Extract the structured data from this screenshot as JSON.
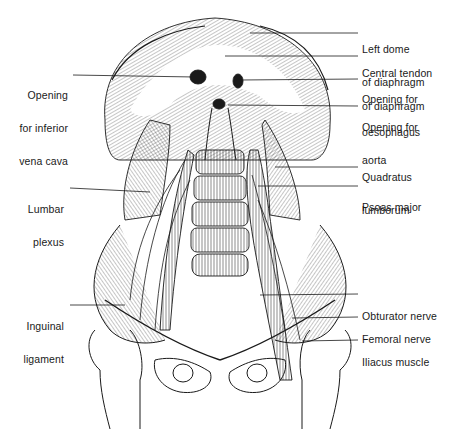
{
  "figure": {
    "ink_color": "#1a1a1a",
    "background": "#ffffff"
  },
  "labels_right": [
    {
      "id": "left-dome",
      "lines": [
        "Left dome",
        "of diaphragm"
      ],
      "x": 362,
      "y": 22,
      "leader": [
        [
          250,
          33
        ],
        [
          358,
          33
        ]
      ]
    },
    {
      "id": "central-tendon",
      "lines": [
        "Central tendon",
        "of diaphragm"
      ],
      "x": 362,
      "y": 45,
      "leader": [
        [
          225,
          56
        ],
        [
          358,
          56
        ]
      ]
    },
    {
      "id": "oesophagus-opening",
      "lines": [
        "Opening for",
        "oesophagus"
      ],
      "x": 362,
      "y": 72,
      "leader": [
        [
          240,
          80
        ],
        [
          358,
          79
        ]
      ]
    },
    {
      "id": "aortic-opening",
      "lines": [
        "Opening for",
        "aorta"
      ],
      "x": 362,
      "y": 99,
      "leader": [
        [
          228,
          105
        ],
        [
          358,
          106
        ]
      ]
    },
    {
      "id": "quadratus-lumborum",
      "lines": [
        "Quadratus",
        "lumborum"
      ],
      "x": 362,
      "y": 150,
      "leader": [
        [
          275,
          167
        ],
        [
          358,
          167
        ]
      ]
    },
    {
      "id": "psoas-major",
      "lines": [
        "Psoas major"
      ],
      "x": 362,
      "y": 178,
      "leader": [
        [
          258,
          186
        ],
        [
          358,
          186
        ]
      ]
    },
    {
      "id": "obturator-nerve",
      "lines": [
        "Obturator nerve"
      ],
      "x": 362,
      "y": 289,
      "leader": [
        [
          260,
          295
        ],
        [
          358,
          294
        ]
      ]
    },
    {
      "id": "femoral-nerve",
      "lines": [
        "Femoral nerve"
      ],
      "x": 362,
      "y": 310,
      "leader": [
        [
          292,
          318
        ],
        [
          358,
          317
        ]
      ]
    },
    {
      "id": "iliacus-muscle",
      "lines": [
        "Iliacus muscle"
      ],
      "x": 362,
      "y": 333,
      "leader": [
        [
          302,
          341
        ],
        [
          358,
          340
        ]
      ]
    }
  ],
  "labels_left": [
    {
      "id": "ivc-opening",
      "lines": [
        "Opening",
        "for inferior",
        "vena cava"
      ],
      "x": 70,
      "y": 67,
      "leader": [
        [
          73,
          75
        ],
        [
          195,
          77
        ]
      ]
    },
    {
      "id": "lumbar-plexus",
      "lines": [
        "Lumbar",
        "plexus"
      ],
      "x": 64,
      "y": 180,
      "leader": [
        [
          70,
          188
        ],
        [
          150,
          192
        ]
      ]
    },
    {
      "id": "inguinal-ligament",
      "lines": [
        "Inguinal",
        "ligament"
      ],
      "x": 64,
      "y": 298,
      "leader": [
        [
          70,
          305
        ],
        [
          125,
          305
        ]
      ]
    }
  ]
}
